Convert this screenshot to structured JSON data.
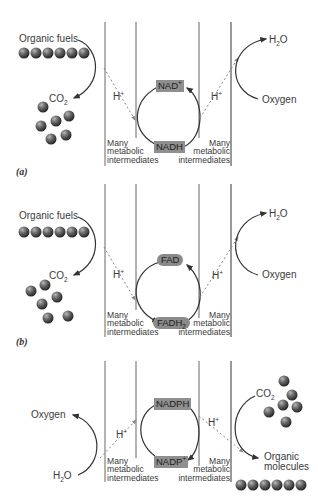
{
  "panels": [
    {
      "letter": "(a)",
      "left_top": "Organic fuels",
      "left_bottom": "CO",
      "left_bottom_sub": "2",
      "right_top": "H",
      "right_top_sub": "2",
      "right_top_tail": "O",
      "right_bottom": "Oxygen",
      "h_plus": "H",
      "plus": "+",
      "carrier_top": "NAD",
      "carrier_top_sup": "+",
      "carrier_bottom": "NADH",
      "carrier_style": "box",
      "intermediates": [
        "Many",
        "metabolic",
        "intermediates"
      ]
    },
    {
      "letter": "(b)",
      "left_top": "Organic fuels",
      "left_bottom": "CO",
      "left_bottom_sub": "2",
      "right_top": "H",
      "right_top_sub": "2",
      "right_top_tail": "O",
      "right_bottom": "Oxygen",
      "h_plus": "H",
      "plus": "+",
      "carrier_top": "FAD",
      "carrier_bottom": "FADH",
      "carrier_bottom_sub": "2",
      "carrier_style": "pill",
      "intermediates": [
        "Many",
        "metabolic",
        "intermediates"
      ]
    },
    {
      "letter": "",
      "left_top": "Oxygen",
      "left_bottom": "H",
      "left_bottom_sub": "2",
      "left_bottom_tail": "O",
      "right_top": "CO",
      "right_top_sub": "2",
      "right_bottom": [
        "Organic",
        "molecules"
      ],
      "h_plus": "H",
      "plus": "+",
      "carrier_top": "NADPH",
      "carrier_bottom": "NADP",
      "carrier_bottom_sup": "+",
      "carrier_style": "box",
      "intermediates": [
        "Many",
        "metabolic",
        "intermediates"
      ]
    }
  ],
  "colors": {
    "line": "#555555",
    "arrow": "#333333",
    "carrier_fill": "#8f8f8f",
    "sphere_dark": "#2e2e2e",
    "sphere_light": "#9a9a9a",
    "dotted": "#888888"
  }
}
